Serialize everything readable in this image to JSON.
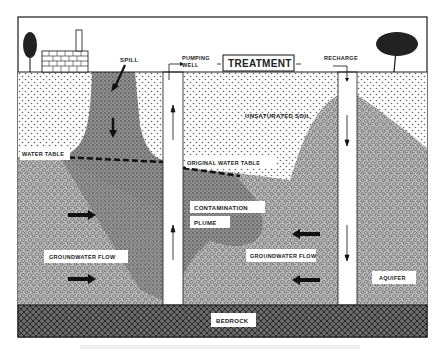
{
  "diagram": {
    "type": "groundwater contamination pump-and-treat cross-section",
    "labels": {
      "spill": "SPILL",
      "pumping_well_line1": "PUMPING",
      "pumping_well_line2": "WELL",
      "treatment": "TREATMENT",
      "recharge": "RECHARGE",
      "unsaturated_soil": "UNSATURATED SOIL",
      "water_table": "WATER TABLE",
      "original_water_table": "ORIGINAL WATER TABLE",
      "contamination_line1": "CONTAMINATION",
      "contamination_line2": "PLUME",
      "groundwater_flow_left": "GROUNDWATER FLOW",
      "groundwater_flow_right": "GROUNDWATER FLOW",
      "aquifer": "AQUIFER",
      "bedrock": "BEDROCK"
    },
    "icons": [
      "tree-icon-left",
      "factory-icon",
      "tree-icon-right",
      "flow-arrow-icon"
    ],
    "colors": {
      "line": "#1a1a1a",
      "background": "#ffffff",
      "soil_dots": "#555555",
      "plume": "#8a8a8a",
      "aquifer": "#b5b5b5",
      "bedrock": "#4a4a4a"
    }
  }
}
